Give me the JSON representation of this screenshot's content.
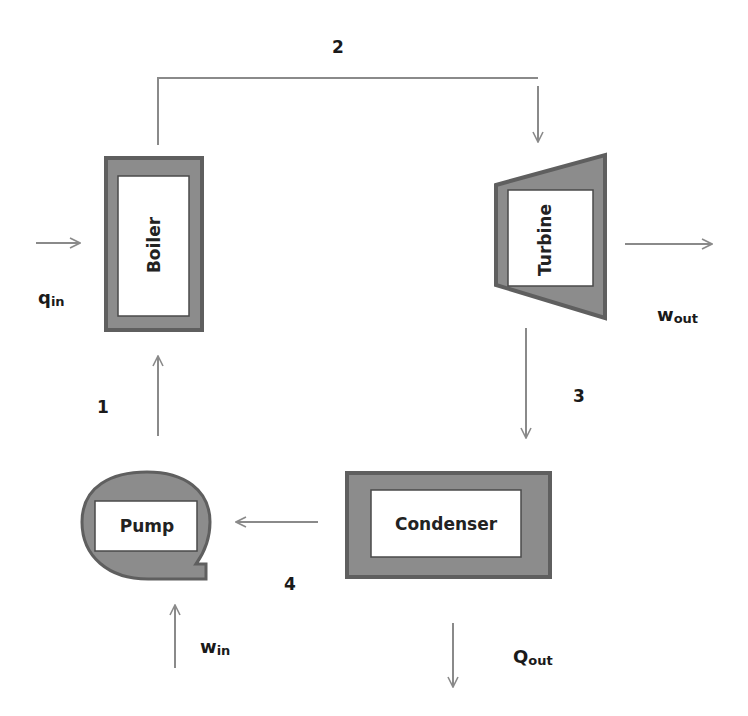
{
  "diagram": {
    "type": "Rankine cycle schematic",
    "components": {
      "boiler": {
        "label": "Boiler"
      },
      "turbine": {
        "label": "Turbine"
      },
      "condenser": {
        "label": "Condenser"
      },
      "pump": {
        "label": "Pump"
      }
    },
    "states": {
      "s1": "1",
      "s2": "2",
      "s3": "3",
      "s4": "4"
    },
    "energy": {
      "q_in": {
        "main": "q",
        "sub": "in"
      },
      "w_out": {
        "main": "w",
        "sub": "out"
      },
      "q_out": {
        "main": "Q",
        "sub": "out"
      },
      "w_in": {
        "main": "w",
        "sub": "in"
      }
    },
    "colors": {
      "component_fill": "#8c8c8c",
      "component_border": "#5f5f5f",
      "arrow": "#8a8a8a",
      "text": "#1a1a1a"
    }
  }
}
